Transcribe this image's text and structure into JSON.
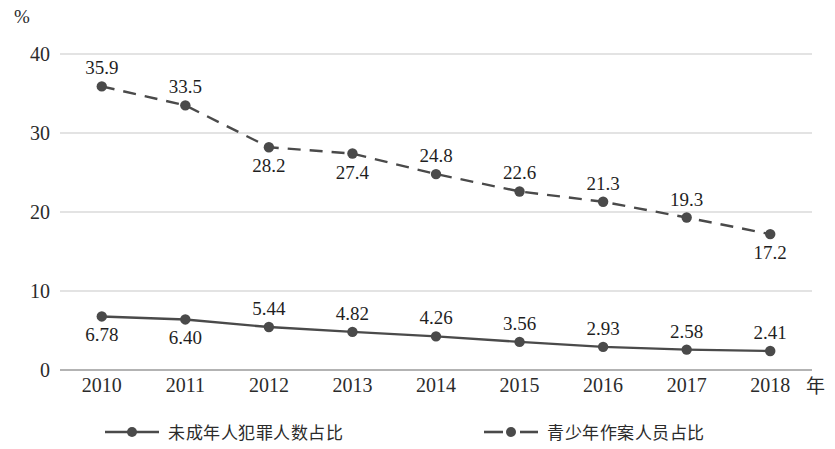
{
  "chart_data": {
    "type": "line",
    "title": "",
    "xlabel": "年",
    "ylabel": "%",
    "categories": [
      "2010",
      "2011",
      "2012",
      "2013",
      "2014",
      "2015",
      "2016",
      "2017",
      "2018"
    ],
    "yticks": [
      "0",
      "10",
      "20",
      "30",
      "40"
    ],
    "ylim": [
      0,
      40
    ],
    "grid": true,
    "legend_position": "bottom",
    "series": [
      {
        "name": "未成年人犯罪人数占比",
        "style": "solid",
        "marker": "circle",
        "color": "#4a4a4a",
        "values": [
          6.78,
          6.4,
          5.44,
          4.82,
          4.26,
          3.56,
          2.93,
          2.58,
          2.41
        ],
        "labels": [
          "6.78",
          "6.40",
          "5.44",
          "4.82",
          "4.26",
          "3.56",
          "2.93",
          "2.58",
          "2.41"
        ],
        "label_positions": [
          "below",
          "below",
          "above",
          "above",
          "above",
          "above",
          "above",
          "above",
          "above"
        ]
      },
      {
        "name": "青少年作案人员占比",
        "style": "dashed",
        "marker": "circle",
        "color": "#4a4a4a",
        "values": [
          35.9,
          33.5,
          28.2,
          27.4,
          24.8,
          22.6,
          21.3,
          19.3,
          17.2
        ],
        "labels": [
          "35.9",
          "33.5",
          "28.2",
          "27.4",
          "24.8",
          "22.6",
          "21.3",
          "19.3",
          "17.2"
        ],
        "label_positions": [
          "above",
          "above",
          "below",
          "below",
          "above",
          "above",
          "above",
          "above",
          "below"
        ]
      }
    ]
  },
  "colors": {
    "gridline": "#c8c8c8",
    "axis": "#9a9a9a",
    "series": "#4a4a4a",
    "text": "#1f1f1f",
    "background": "#ffffff"
  }
}
